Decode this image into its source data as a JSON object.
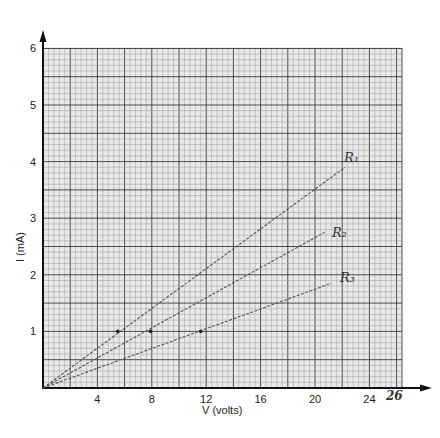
{
  "chart_data": {
    "type": "line",
    "title": "",
    "xlabel": "V (volts)",
    "ylabel": "I (mA)",
    "xlim": [
      0,
      26
    ],
    "ylim": [
      0,
      6
    ],
    "x_ticks": [
      "4",
      "8",
      "12",
      "16",
      "20",
      "24"
    ],
    "x_extra_tick_handwritten": "26",
    "y_ticks": [
      "1",
      "2",
      "3",
      "4",
      "5",
      "6"
    ],
    "grid": true,
    "legend": "inline handwritten labels at line ends",
    "series": [
      {
        "name": "R1",
        "label": "R₁",
        "points": [
          [
            0,
            0
          ],
          [
            5.5,
            1.0
          ],
          [
            22.2,
            3.9
          ]
        ],
        "marked_point": [
          5.5,
          1.0
        ]
      },
      {
        "name": "R2",
        "label": "R₂",
        "points": [
          [
            0,
            0
          ],
          [
            7.9,
            1.0
          ],
          [
            20.7,
            2.75
          ]
        ],
        "marked_point": [
          7.9,
          1.0
        ]
      },
      {
        "name": "R3",
        "label": "R₃",
        "points": [
          [
            0,
            0
          ],
          [
            11.6,
            1.0
          ],
          [
            21.2,
            1.85
          ]
        ],
        "marked_point": [
          11.6,
          1.0
        ]
      }
    ]
  },
  "labels": {
    "xlabel": "V (volts)",
    "ylabel": "I (mA)",
    "x26": "26",
    "r1": "R₁",
    "r2": "R₂",
    "r3": "R₃"
  },
  "colors": {
    "grid_fine": "#9a9a9a",
    "grid_major": "#3a3a3a",
    "axis": "#111111",
    "line": "#555555"
  }
}
